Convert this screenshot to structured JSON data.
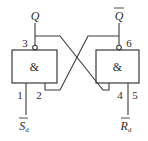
{
  "diagram": {
    "type": "SR latch (two NAND gates, cross-coupled)",
    "gates": [
      {
        "id": "left",
        "symbol": "&",
        "output_pin": "3",
        "inputs": [
          "1",
          "2"
        ],
        "output_label": "Q",
        "input_label": "S",
        "input_label_sub": "d"
      },
      {
        "id": "right",
        "symbol": "&",
        "output_pin": "6",
        "inputs": [
          "4",
          "5"
        ],
        "output_label": "Q",
        "input_label": "R",
        "input_label_sub": "d"
      }
    ],
    "labels": {
      "q": "Q",
      "q_bar": "Q",
      "s_d": "S",
      "s_d_sub": "d",
      "r_d": "R",
      "r_d_sub": "d",
      "pin1": "1",
      "pin2": "2",
      "pin3": "3",
      "pin4": "4",
      "pin5": "5",
      "pin6": "6",
      "and_left": "&",
      "and_right": "&"
    },
    "colors": {
      "line": "#3a3a3a",
      "text": "#2a2a2a",
      "background": "#ffffff"
    }
  }
}
